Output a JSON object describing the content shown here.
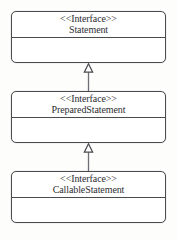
{
  "diagram": {
    "type": "uml-class-diagram",
    "title": "",
    "background_color": "#fdfdfc",
    "line_color": "#4a4a4f",
    "text_color": "#2e2e31",
    "classes": [
      {
        "id": "statement",
        "stereotype": "<<Interface>>",
        "name": "Statement",
        "compartments": [
          "attributes",
          "operations"
        ],
        "attributes": [],
        "operations": []
      },
      {
        "id": "preparedstatement",
        "stereotype": "<<Interface>>",
        "name": "PreparedStatement",
        "compartments": [
          "attributes",
          "operations"
        ],
        "attributes": [],
        "operations": []
      },
      {
        "id": "callablestatement",
        "stereotype": "<<Interface>>",
        "name": "CallableStatement",
        "compartments": [
          "attributes",
          "operations"
        ],
        "attributes": [],
        "operations": []
      }
    ],
    "relationships": [
      {
        "id": "rel-prepared-extends-statement",
        "kind": "generalization",
        "arrow": "hollow-triangle",
        "line_style": "solid",
        "from": "preparedstatement",
        "to": "statement",
        "label": ""
      },
      {
        "id": "rel-callable-extends-prepared",
        "kind": "generalization",
        "arrow": "hollow-triangle",
        "line_style": "solid",
        "from": "callablestatement",
        "to": "preparedstatement",
        "label": ""
      }
    ]
  }
}
